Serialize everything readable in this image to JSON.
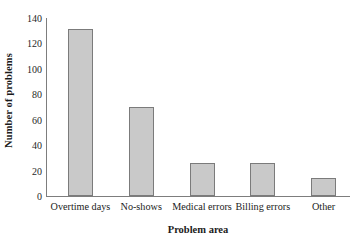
{
  "chart_data": {
    "type": "bar",
    "title": "",
    "xlabel": "Problem area",
    "ylabel": "Number of problems",
    "categories": [
      "Overtime days",
      "No-shows",
      "Medical errors",
      "Billing errors",
      "Other"
    ],
    "values": [
      131,
      70,
      26,
      26,
      14
    ],
    "series": [
      {
        "name": "Number of problems",
        "values": [
          131,
          70,
          26,
          26,
          14
        ]
      }
    ],
    "ylim": [
      0,
      140
    ],
    "y_ticks": [
      0,
      20,
      40,
      60,
      80,
      100,
      120,
      140
    ],
    "y_tick_labels": [
      "0",
      "20",
      "40",
      "60",
      "80",
      "100",
      "120",
      "140"
    ],
    "grid": false,
    "legend": false,
    "legend_position": "none",
    "bar_fill_color": "#c9c9c9",
    "bar_border_color": "#7b7b7b",
    "axis_color": "#7d7d7d",
    "background_color": "#ffffff",
    "axes_shown": [
      "left",
      "bottom"
    ]
  }
}
